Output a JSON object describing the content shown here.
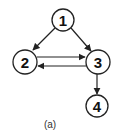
{
  "diagram": {
    "type": "directed-graph",
    "caption": "(a)",
    "nodes": [
      {
        "id": "1",
        "label": "1",
        "x": 63,
        "y": 20,
        "r": 11
      },
      {
        "id": "2",
        "label": "2",
        "x": 25,
        "y": 62,
        "r": 12
      },
      {
        "id": "3",
        "label": "3",
        "x": 98,
        "y": 62,
        "r": 12
      },
      {
        "id": "4",
        "label": "4",
        "x": 97,
        "y": 106,
        "r": 11
      }
    ],
    "edges": [
      {
        "from": "1",
        "to": "2"
      },
      {
        "from": "1",
        "to": "3"
      },
      {
        "from": "2",
        "to": "3"
      },
      {
        "from": "3",
        "to": "2"
      },
      {
        "from": "3",
        "to": "4"
      }
    ],
    "colors": {
      "stroke": "#222222",
      "fill": "#ffffff",
      "text": "#111111"
    }
  }
}
